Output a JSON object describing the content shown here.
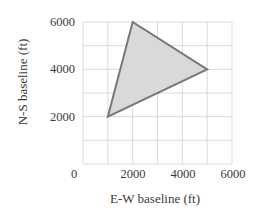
{
  "chart_data": {
    "type": "area",
    "title": "",
    "xlabel": "E-W baseline (ft)",
    "ylabel": "N-S baseline (ft)",
    "xlim": [
      0,
      6000
    ],
    "ylim": [
      0,
      6000
    ],
    "grid": true,
    "grid_step": 1000,
    "x_ticks": [
      0,
      2000,
      4000,
      6000
    ],
    "y_ticks": [
      0,
      2000,
      4000,
      6000
    ],
    "x_tick_labels": [
      "0",
      "2000",
      "4000",
      "6000"
    ],
    "y_tick_labels": [
      "2000",
      "4000",
      "6000"
    ],
    "legend": null,
    "series": [
      {
        "name": "triangle",
        "shape": "polygon",
        "points": [
          {
            "x": 1000,
            "y": 2000
          },
          {
            "x": 2000,
            "y": 6000
          },
          {
            "x": 5000,
            "y": 4000
          }
        ],
        "fill": "#d9d9d9",
        "stroke": "#777777"
      }
    ]
  },
  "colors": {
    "grid": "#d0d0d0",
    "fill": "#d9d9d9",
    "stroke": "#777777",
    "text": "#3a3a3a"
  },
  "labels": {
    "xlabel": "E-W baseline (ft)",
    "ylabel": "N-S baseline (ft)",
    "origin": "0",
    "x2000": "2000",
    "x4000": "4000",
    "x6000": "6000",
    "y2000": "2000",
    "y4000": "4000",
    "y6000": "6000"
  }
}
